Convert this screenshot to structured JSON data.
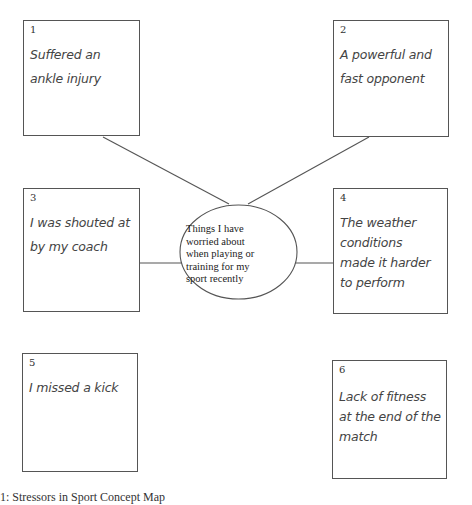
{
  "diagram": {
    "center": {
      "label": "Things I have worried about when playing or training for my sport recently",
      "lines": [
        "Things I have",
        "worried about",
        "when playing or",
        "training for my",
        "sport recently"
      ]
    },
    "nodes": [
      {
        "number": "1",
        "lines": [
          "Suffered an",
          "ankle injury"
        ]
      },
      {
        "number": "2",
        "lines": [
          "A powerful and",
          "fast opponent"
        ]
      },
      {
        "number": "3",
        "lines": [
          "I was shouted at",
          "by my coach"
        ]
      },
      {
        "number": "4",
        "lines": [
          "The weather",
          "conditions",
          "made it harder",
          "to perform"
        ]
      },
      {
        "number": "5",
        "lines": [
          "I missed a kick"
        ]
      },
      {
        "number": "6",
        "lines": [
          "Lack of fitness",
          "at the end of the",
          "match"
        ]
      }
    ],
    "edges": [
      {
        "from": "1",
        "to": "center"
      },
      {
        "from": "2",
        "to": "center"
      },
      {
        "from": "3",
        "to": "center"
      },
      {
        "from": "4",
        "to": "center"
      }
    ],
    "caption": "1: Stressors in Sport Concept Map"
  },
  "colors": {
    "stroke": "#555555",
    "text": "#444444",
    "background": "#ffffff"
  }
}
